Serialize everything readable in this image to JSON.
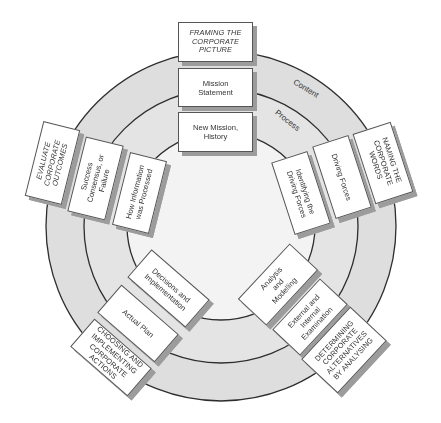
{
  "diagram": {
    "rings": {
      "center": [
        221,
        226
      ],
      "outer_radius": 175,
      "middle_radius": 137,
      "inner_radius": 94,
      "outer_band_color": "#dedede",
      "middle_band_color": "#e4e4e4",
      "inner_fill_color": "#f3f3f3",
      "stroke_color": "#2e2e2e"
    },
    "ring_labels": {
      "content": "Content",
      "process": "Process"
    },
    "groups": {
      "top": {
        "outer": "FRAMING THE CORPORATE PICTURE",
        "middle": "Mission Statement",
        "inner": "New Mission, History"
      },
      "right": {
        "outer": "NAMING THE CORPORATE WORDS",
        "middle": "Driving Forces",
        "inner": "Identifying the Driving Forces"
      },
      "bottom_right": {
        "outer": "DETERMINING CORPORATE ALTERNATIVES BY ANALYSING",
        "middle": "External and Internal Examination",
        "inner": "Analysis and Modelling"
      },
      "bottom_left": {
        "outer": "CHOOSING AND IMPLEMENTING CORPORATE ACTIONS",
        "middle": "Actual Plan",
        "inner": "Decisions and Implementation"
      },
      "left": {
        "outer": "EVALUATE CORPORATE OUTCOMES",
        "middle": "Success Consensus, or Failure",
        "inner": "How Information was Processed"
      }
    }
  }
}
